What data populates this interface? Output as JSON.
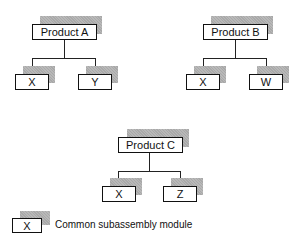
{
  "diagram": {
    "trees": [
      {
        "parent": "Product A",
        "children": [
          "X",
          "Y"
        ]
      },
      {
        "parent": "Product B",
        "children": [
          "X",
          "W"
        ]
      },
      {
        "parent": "Product C",
        "children": [
          "X",
          "Z"
        ]
      }
    ],
    "legend": {
      "symbol_label": "X",
      "description": "Common subassembly module"
    },
    "colors": {
      "shadow": "#a9a9a9",
      "border": "#111111"
    }
  }
}
